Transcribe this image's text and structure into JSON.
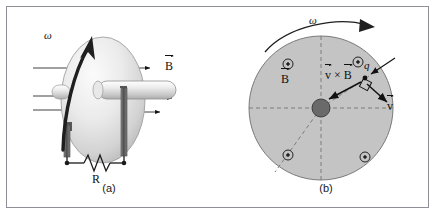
{
  "figure": {
    "kind": "two-panel-physics-diagram",
    "background_color": "#ffffff",
    "border_color": "#8f8f97"
  },
  "panel_a": {
    "caption": "(a)",
    "omega_label": "ω",
    "omega_arrow": "curved-arrow-up-right",
    "b_label_head": "B",
    "b_field_lines": 4,
    "b_field_direction": "right",
    "resistor_label": "R",
    "resistor_symbol": "zigzag",
    "disc_fill_light": "#f2f2f2",
    "disc_fill_dark": "#b9b9b9",
    "axle_fill": "#e4e4e4",
    "brush_fill": "#6d6d6d",
    "wire_color": "#1a1a1a"
  },
  "panel_b": {
    "caption": "(b)",
    "omega_label": "ω",
    "omega_arrow": "curved-arrow-clockwise",
    "disc_fill": "#c4c4c4",
    "disc_stroke": "#7a7a7a",
    "hub_fill": "#6a6a6a",
    "dashed_color": "#7d7d7d",
    "field_symbol": "⊙",
    "field_symbol_count": 4,
    "b_label_head": "B",
    "charge_label": "q",
    "cross_label_v": "v",
    "cross_label_times": "×",
    "cross_label_b": "B",
    "velocity_label": "v",
    "right_angle_marker": true,
    "vector_color": "#111111"
  }
}
